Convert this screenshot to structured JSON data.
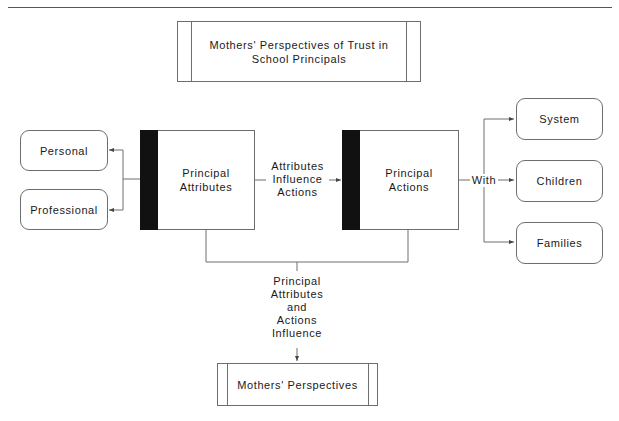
{
  "header": {
    "running_title_fragment": ""
  },
  "diagram": {
    "title": "Mothers' Perspectives of Trust in School Principals",
    "title_lines": [
      "Mothers' Perspectives of Trust in",
      "School Principals"
    ],
    "nodes": {
      "personal": "Personal",
      "professional": "Professional",
      "principal_attributes": [
        "Principal",
        "Attributes"
      ],
      "principal_actions": [
        "Principal",
        "Actions"
      ],
      "system": "System",
      "children": "Children",
      "families": "Families",
      "mothers_perspectives": "Mothers' Perspectives"
    },
    "edge_labels": {
      "attributes_influence_actions": [
        "Attributes",
        "Influence",
        "Actions"
      ],
      "with": "With",
      "combined_influence": [
        "Principal",
        "Attributes",
        "and",
        "Actions",
        "Influence"
      ]
    },
    "edges": [
      {
        "from": "Principal Attributes",
        "to": "Personal"
      },
      {
        "from": "Principal Attributes",
        "to": "Professional"
      },
      {
        "from": "Principal Attributes",
        "to": "Principal Actions",
        "label": "Attributes Influence Actions"
      },
      {
        "from": "Principal Actions",
        "to": "System",
        "label": "With"
      },
      {
        "from": "Principal Actions",
        "to": "Children",
        "label": "With"
      },
      {
        "from": "Principal Actions",
        "to": "Families",
        "label": "With"
      },
      {
        "from": [
          "Principal Attributes",
          "Principal Actions"
        ],
        "to": "Mothers' Perspectives",
        "label": "Principal Attributes and Actions Influence"
      }
    ],
    "colors": {
      "line": "#6e6e6e",
      "bar": "#111111",
      "text": "#1a1a1a"
    }
  }
}
